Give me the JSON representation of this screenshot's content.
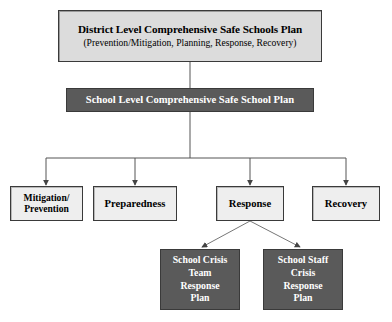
{
  "diagram": {
    "type": "org-chart",
    "colors": {
      "box_light_fill": "#dcdcdc",
      "box_pale_fill": "#eeeeee",
      "box_dark_fill": "#5a5a5a",
      "border": "#3a3a3a",
      "dark_text": "#000000",
      "light_text": "#ffffff",
      "connector": "#555555",
      "background": "#ffffff"
    },
    "level1": {
      "title": "District Level Comprehensive Safe Schools Plan",
      "subtitle": "(Prevention/Mitigation, Planning, Response, Recovery)"
    },
    "level2": {
      "title": "School Level Comprehensive Safe School Plan"
    },
    "level3": [
      {
        "id": "mitigation",
        "line1": "Mitigation/",
        "line2": "Prevention"
      },
      {
        "id": "preparedness",
        "line1": "Preparedness",
        "line2": ""
      },
      {
        "id": "response",
        "line1": "Response",
        "line2": ""
      },
      {
        "id": "recovery",
        "line1": "Recovery",
        "line2": ""
      }
    ],
    "level4": [
      {
        "id": "school-crisis-team-response-plan",
        "line1": "School Crisis",
        "line2": "Team",
        "line3": "Response",
        "line4": "Plan"
      },
      {
        "id": "school-staff-crisis-response-plan",
        "line1": "School Staff",
        "line2": "Crisis",
        "line3": "Response",
        "line4": "Plan"
      }
    ]
  }
}
